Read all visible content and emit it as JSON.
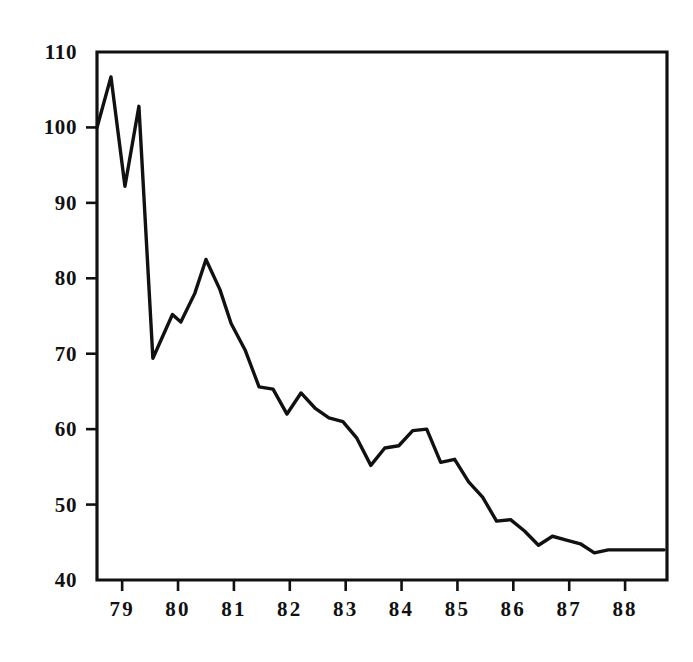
{
  "chart_data": {
    "type": "line",
    "title": "",
    "subtitle": "",
    "xlabel": "",
    "ylabel": "",
    "legend": [],
    "grid": false,
    "xlim": [
      78.55,
      88.75
    ],
    "ylim": [
      40,
      110
    ],
    "y_ticks": [
      40,
      50,
      60,
      70,
      80,
      90,
      100,
      110
    ],
    "y_tick_labels": [
      "40",
      "50",
      "60",
      "70",
      "80",
      "90",
      "100",
      "110"
    ],
    "x_ticks": [
      79,
      80,
      81,
      82,
      83,
      84,
      85,
      86,
      87,
      88
    ],
    "x_tick_labels": [
      "79",
      "80",
      "81",
      "82",
      "83",
      "84",
      "85",
      "86",
      "87",
      "88"
    ],
    "line_color": "#111111",
    "background_color": "#ffffff",
    "series": [
      {
        "name": "series-1",
        "x": [
          78.55,
          78.8,
          79.05,
          79.3,
          79.55,
          79.9,
          80.05,
          80.3,
          80.5,
          80.75,
          80.95,
          81.2,
          81.45,
          81.7,
          81.95,
          82.2,
          82.45,
          82.7,
          82.95,
          83.2,
          83.45,
          83.7,
          83.95,
          84.2,
          84.45,
          84.7,
          84.95,
          85.2,
          85.45,
          85.7,
          85.95,
          86.2,
          86.45,
          86.7,
          86.95,
          87.2,
          87.45,
          87.7,
          87.95,
          88.2,
          88.45,
          88.7
        ],
        "y": [
          100.0,
          106.7,
          92.2,
          102.8,
          69.4,
          75.2,
          74.2,
          78.0,
          82.5,
          78.5,
          74.0,
          70.5,
          65.6,
          65.3,
          62.0,
          64.8,
          62.8,
          61.5,
          61.0,
          58.8,
          55.2,
          57.5,
          57.8,
          59.8,
          60.0,
          55.6,
          56.0,
          53.0,
          51.0,
          47.8,
          48.0,
          46.5,
          44.6,
          45.8,
          45.3,
          44.8,
          43.6,
          44.0,
          44.0,
          44.0,
          44.0,
          44.0
        ]
      }
    ]
  },
  "figure": {
    "plot_area": {
      "left": 97,
      "top": 52,
      "right": 667,
      "bottom": 580
    },
    "tick_length": 11
  }
}
